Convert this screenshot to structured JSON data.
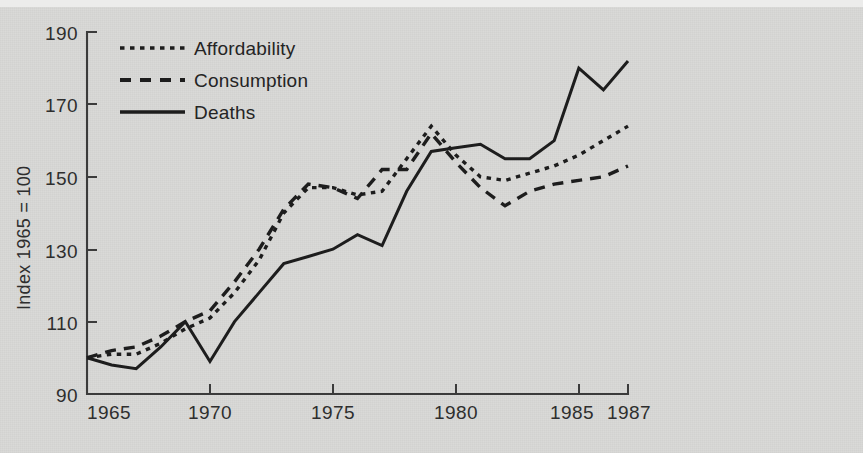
{
  "figure": {
    "background_color": "#d8d8d6",
    "ink_color": "#1d1d1d"
  },
  "axes": {
    "y_title": "Index 1965 = 100",
    "y_ticks": [
      "190",
      "170",
      "150",
      "130",
      "110",
      "90"
    ],
    "x_ticks": [
      "1965",
      "1970",
      "1975",
      "1980",
      "1985",
      "1987"
    ]
  },
  "legend": {
    "position": "top-left-inside",
    "entries": [
      {
        "label": "Affordability",
        "style": "dotted"
      },
      {
        "label": "Consumption",
        "style": "dashed"
      },
      {
        "label": "Deaths",
        "style": "solid"
      }
    ]
  },
  "chart_data": {
    "type": "line",
    "title": "",
    "subtitle": "",
    "xlabel": "",
    "ylabel": "Index 1965 = 100",
    "xlim": [
      1965,
      1987
    ],
    "ylim": [
      90,
      190
    ],
    "grid": false,
    "legend_position": "top-left-inside",
    "x": [
      1965,
      1966,
      1967,
      1968,
      1969,
      1970,
      1971,
      1972,
      1973,
      1974,
      1975,
      1976,
      1977,
      1978,
      1979,
      1980,
      1981,
      1982,
      1983,
      1984,
      1985,
      1986,
      1987
    ],
    "annotations": [],
    "series": [
      {
        "name": "Affordability",
        "style": "dotted",
        "values": [
          100,
          101,
          101,
          104,
          108,
          111,
          118,
          127,
          140,
          147,
          147,
          145,
          146,
          155,
          164,
          156,
          150,
          149,
          151,
          153,
          156,
          160,
          164
        ]
      },
      {
        "name": "Consumption",
        "style": "dashed",
        "values": [
          100,
          102,
          103,
          106,
          110,
          113,
          121,
          130,
          141,
          148,
          147,
          144,
          152,
          152,
          162,
          154,
          147,
          142,
          146,
          148,
          149,
          150,
          153
        ]
      },
      {
        "name": "Deaths",
        "style": "solid",
        "values": [
          100,
          98,
          97,
          103,
          110,
          99,
          110,
          118,
          126,
          128,
          130,
          134,
          131,
          146,
          157,
          158,
          159,
          155,
          155,
          160,
          180,
          174,
          182
        ]
      }
    ]
  }
}
